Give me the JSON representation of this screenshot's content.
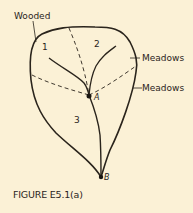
{
  "figure": {
    "caption": "FIGURE E5.1(a)",
    "labels": {
      "wooded": "Wooded",
      "meadows_upper": "Meadows",
      "meadows_lower": "Meadows"
    },
    "subareas": [
      "1",
      "2",
      "3"
    ],
    "points": {
      "a": "A",
      "b": "B"
    },
    "colors": {
      "background": "#fbf1d6",
      "ink": "#2a241c"
    }
  }
}
